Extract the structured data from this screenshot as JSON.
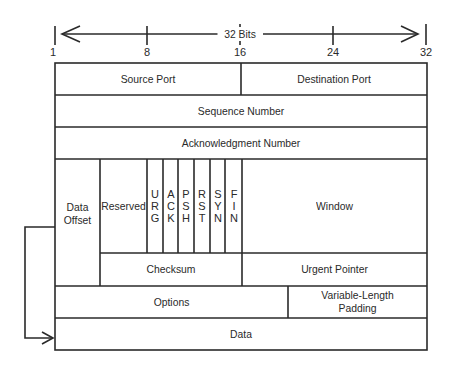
{
  "ruler": {
    "label": "32 Bits",
    "ticks": [
      "1",
      "8",
      "16",
      "24",
      "32"
    ]
  },
  "fields": {
    "source_port": "Source Port",
    "destination_port": "Destination Port",
    "sequence_number": "Sequence Number",
    "acknowledgment_number": "Acknowledgment Number",
    "data_offset_line1": "Data",
    "data_offset_line2": "Offset",
    "reserved": "Reserved",
    "window": "Window",
    "checksum": "Checksum",
    "urgent_pointer": "Urgent Pointer",
    "options": "Options",
    "padding_line1": "Variable-Length",
    "padding_line2": "Padding",
    "data": "Data"
  },
  "flags": [
    {
      "name": "URG",
      "letters": [
        "U",
        "R",
        "G"
      ]
    },
    {
      "name": "ACK",
      "letters": [
        "A",
        "C",
        "K"
      ]
    },
    {
      "name": "PSH",
      "letters": [
        "P",
        "S",
        "H"
      ]
    },
    {
      "name": "RST",
      "letters": [
        "R",
        "S",
        "T"
      ]
    },
    {
      "name": "SYN",
      "letters": [
        "S",
        "Y",
        "N"
      ]
    },
    {
      "name": "FIN",
      "letters": [
        "F",
        "I",
        "N"
      ]
    }
  ]
}
